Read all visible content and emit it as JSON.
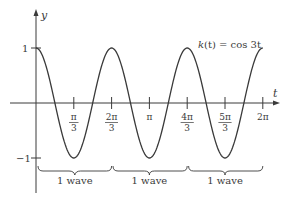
{
  "chart_data": {
    "type": "line",
    "title": "",
    "function_label": "k(t) = cos 3t",
    "xlabel": "t",
    "ylabel": "y",
    "xlim": [
      0,
      6.283
    ],
    "ylim": [
      -1,
      1
    ],
    "grid": false,
    "x_ticks": [
      {
        "value": 1.0472,
        "num": "π",
        "den": "3"
      },
      {
        "value": 2.0944,
        "num": "2π",
        "den": "3"
      },
      {
        "value": 3.1416,
        "num": "π",
        "den": ""
      },
      {
        "value": 4.1888,
        "num": "4π",
        "den": "3"
      },
      {
        "value": 5.236,
        "num": "5π",
        "den": "3"
      },
      {
        "value": 6.2832,
        "num": "2π",
        "den": ""
      }
    ],
    "y_ticks": [
      {
        "value": 1,
        "label": "1"
      },
      {
        "value": -1,
        "label": "−1"
      }
    ],
    "series": [
      {
        "name": "k(t) = cos 3t",
        "x": [
          0,
          0.5236,
          1.0472,
          1.5708,
          2.0944,
          2.618,
          3.1416,
          3.6652,
          4.1888,
          4.7124,
          5.236,
          5.7596,
          6.2832
        ],
        "values": [
          1,
          0,
          -1,
          0,
          1,
          0,
          -1,
          0,
          1,
          0,
          -1,
          0,
          1
        ]
      }
    ],
    "annotations": [
      {
        "type": "brace",
        "from": 0,
        "to": 2.0944,
        "label": "1 wave"
      },
      {
        "type": "brace",
        "from": 2.0944,
        "to": 4.1888,
        "label": "1 wave"
      },
      {
        "type": "brace",
        "from": 4.1888,
        "to": 6.2832,
        "label": "1 wave"
      }
    ]
  },
  "labels": {
    "y_axis": "y",
    "x_axis": "t",
    "func_k": "k",
    "func_rest": "(t) = cos 3t",
    "y_one": "1",
    "y_neg_one": "−1",
    "tick_1_num": "π",
    "tick_1_den": "3",
    "tick_2_num": "2π",
    "tick_2_den": "3",
    "tick_3": "π",
    "tick_4_num": "4π",
    "tick_4_den": "3",
    "tick_5_num": "5π",
    "tick_5_den": "3",
    "tick_6": "2π",
    "brace_1": "1 wave",
    "brace_2": "1 wave",
    "brace_3": "1 wave"
  },
  "colors": {
    "stroke": "#3a3a3a",
    "background": "#ffffff"
  }
}
